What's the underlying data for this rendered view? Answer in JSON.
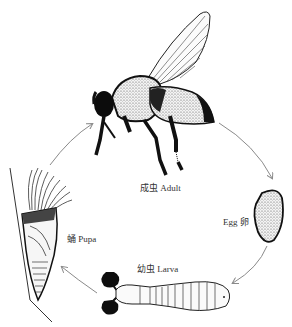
{
  "diagram": {
    "type": "life-cycle",
    "stages": [
      {
        "id": "adult",
        "label": "成虫 Adult",
        "position": "top"
      },
      {
        "id": "egg",
        "label": "Egg 卵",
        "position": "right"
      },
      {
        "id": "larva",
        "label": "幼虫 Larva",
        "position": "bottom"
      },
      {
        "id": "pupa",
        "label": "蛹 Pupa",
        "position": "left"
      }
    ],
    "flow": [
      "adult",
      "egg",
      "larva",
      "pupa",
      "adult"
    ],
    "colors": {
      "ink": "#111111",
      "arrow": "#8a8a8a",
      "background": "#ffffff"
    }
  }
}
